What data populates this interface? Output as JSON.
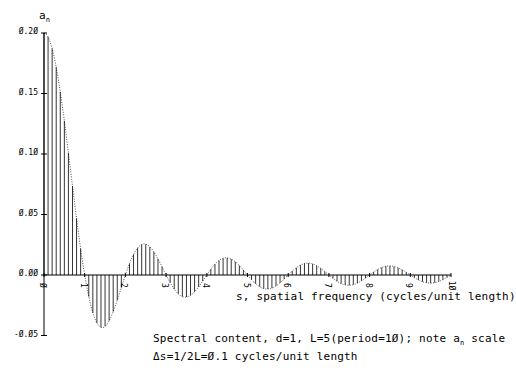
{
  "chart_data": {
    "type": "bar",
    "subtype": "stem",
    "subtitle": "Δs=1/2L=0.1 cycles/unit length",
    "xlabel": "s, spatial frequency (cycles/unit length)",
    "ylabel": "a_n",
    "xlim": [
      0,
      10
    ],
    "ylim": [
      -0.05,
      0.2
    ],
    "x_ticks": [
      "0",
      "1",
      "2",
      "3",
      "4",
      "5",
      "6",
      "7",
      "8",
      "9",
      "10"
    ],
    "y_ticks": [
      "0.20",
      "0.15",
      "0.10",
      "0.05",
      "0.00",
      "-0.05"
    ],
    "grid": false,
    "legend": null,
    "formula": "a_n = (d/L) * sin(pi*s*d)/(pi*s*d), s = n*0.1",
    "params": {
      "d": 1,
      "L": 5,
      "period": 10,
      "ds": 0.1
    },
    "series": [
      {
        "name": "a_n",
        "x_start": 0,
        "x_step": 0.1,
        "count": 101,
        "envelope": "dotted"
      }
    ],
    "key_values": {
      "a_0": 0.2,
      "first_min": {
        "s": 1.43,
        "a": -0.043
      },
      "second_max": {
        "s": 2.46,
        "a": 0.026
      },
      "zeros": [
        1,
        2,
        3,
        4,
        5,
        6,
        7,
        8,
        9,
        10
      ]
    }
  },
  "labels": {
    "yaxis": "a",
    "yaxis_sub": "n",
    "xaxis": "s, spatial frequency (cycles/unit length)",
    "caption1_a": "Spectral content, d=1, L=5(period=1Ø); note a",
    "caption1_sub": "n",
    "caption1_b": " scale",
    "caption2": "Δs=1/2L=Ø.1 cycles/unit length",
    "yticks": [
      "Ø.2Ø",
      "Ø.15",
      "Ø.1Ø",
      "Ø.Ø5",
      "Ø.ØØ",
      "-Ø.Ø5"
    ],
    "xticks": [
      "Ø",
      "1",
      "2",
      "3",
      "4",
      "5",
      "6",
      "7",
      "8",
      "9",
      "1Ø"
    ]
  }
}
